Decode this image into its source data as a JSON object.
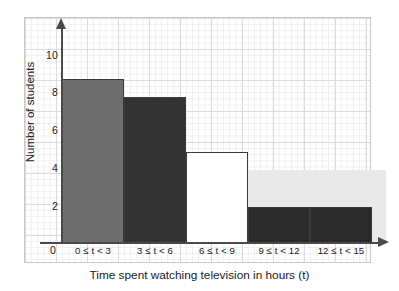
{
  "chart_data": {
    "type": "bar",
    "title": "",
    "subtitle": "",
    "xlabel": "Time spent watching television in hours (t)",
    "ylabel": "Number of students",
    "categories": [
      "0 ≤ t < 3",
      "3 ≤ t < 6",
      "6 ≤ t < 9",
      "9 ≤ t < 12",
      "12 ≤ t < 15"
    ],
    "values": [
      4,
      9,
      8,
      5,
      2
    ],
    "bar_colors": [
      "#e9e9e9",
      "#6e6e6e",
      "#333333",
      "#ffffff",
      "#2b2b2b"
    ],
    "bar_edge_color": "#3a3a3a",
    "ylim": [
      0,
      11
    ],
    "ytick_labels": [
      "2",
      "4",
      "6",
      "8",
      "10"
    ],
    "ytick_values": [
      2,
      4,
      6,
      8,
      10
    ],
    "origin_label": "0",
    "grid": true,
    "grid_color": "#dcdcdc",
    "legend": "none",
    "axis_color": "#4a4a4a",
    "background": "#ffffff"
  }
}
